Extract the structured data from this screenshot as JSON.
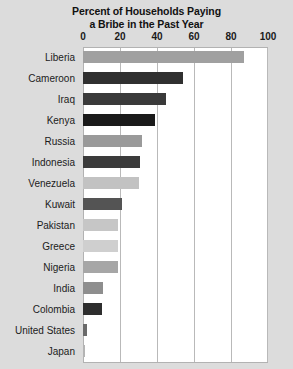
{
  "chart_data": {
    "type": "bar",
    "orientation": "horizontal",
    "title": "Percent of Households Paying a Bribe in the Past Year",
    "title_lines": [
      "Percent of Households Paying",
      "a Bribe in the Past Year"
    ],
    "xlabel": "",
    "ylabel": "",
    "xlim": [
      0,
      100
    ],
    "xticks": [
      0,
      20,
      40,
      60,
      80,
      100
    ],
    "xtick_labels": [
      "0",
      "20",
      "40",
      "60",
      "80",
      "100"
    ],
    "grid": true,
    "legend": "none",
    "categories": [
      "Liberia",
      "Cameroon",
      "Iraq",
      "Kenya",
      "Russia",
      "Indonesia",
      "Venezuela",
      "Kuwait",
      "Pakistan",
      "Greece",
      "Nigeria",
      "India",
      "Colombia",
      "United States",
      "Japan"
    ],
    "values": [
      87,
      54,
      45,
      39,
      32,
      31,
      30,
      21,
      19,
      19,
      19,
      11,
      10,
      2,
      1
    ],
    "bar_colors": [
      "#a0a0a0",
      "#303030",
      "#3a3a3a",
      "#1a1a1a",
      "#9a9a9a",
      "#3b3b3b",
      "#c2c2c2",
      "#545454",
      "#c6c6c6",
      "#cfcfcf",
      "#a6a6a6",
      "#8e8e8e",
      "#2e2e2e",
      "#6a6a6a",
      "#b4b4b4"
    ]
  },
  "colors": {
    "page_background": "#dcdcdc",
    "plot_background": "#ffffff",
    "gridline": "#b9b9b9",
    "axis_border": "#b2b2b2",
    "text": "#1b1b1b",
    "title_text": "#111111"
  }
}
